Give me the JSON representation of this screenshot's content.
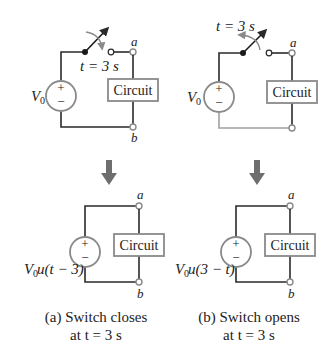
{
  "colors": {
    "wire": "#2a2a2a",
    "wire_inactive": "#a0a0a0",
    "box_border": "#8a8a8a",
    "source_border": "#8a8a8a",
    "arrow": "#6e6e6e",
    "terminal": "#8a8a8a"
  },
  "panel_a": {
    "top": {
      "switch_label": "t = 3 s",
      "source_label": "V",
      "source_sub": "0",
      "plus": "+",
      "minus": "−",
      "box_label": "Circuit",
      "terminal_a": "a",
      "terminal_b": "b"
    },
    "bottom": {
      "source_label": "V",
      "source_sub": "0",
      "source_func": " u(t − 3)",
      "plus": "+",
      "minus": "−",
      "box_label": "Circuit",
      "terminal_a": "a",
      "terminal_b": "b"
    },
    "caption_line1": "(a) Switch closes",
    "caption_line2": "at t = 3 s"
  },
  "panel_b": {
    "top": {
      "switch_label": "t = 3 s",
      "source_label": "V",
      "source_sub": "0",
      "plus": "+",
      "minus": "−",
      "box_label": "Circuit",
      "terminal_a": "a",
      "terminal_b": "b"
    },
    "bottom": {
      "source_label": "V",
      "source_sub": "0",
      "source_func": " u(3 − t)",
      "plus": "+",
      "minus": "−",
      "box_label": "Circuit",
      "terminal_a": "a",
      "terminal_b": "b"
    },
    "caption_line1": "(b) Switch opens",
    "caption_line2": "at t = 3 s"
  }
}
